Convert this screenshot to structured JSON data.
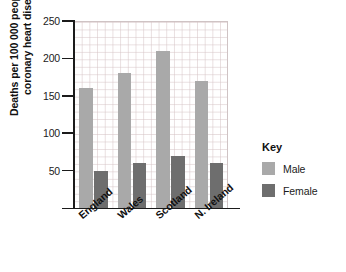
{
  "chart_data": {
    "type": "bar",
    "title": "",
    "xlabel": "",
    "ylabel": "Deaths per 100 000 people from coronary heart disease",
    "ylabel_lines": [
      "Deaths per 100 000 people from",
      "coronary heart disease"
    ],
    "categories": [
      "England",
      "Wales",
      "Scotland",
      "N. Ireland"
    ],
    "series": [
      {
        "name": "Male",
        "color": "#a9a9a9",
        "values": [
          160,
          180,
          210,
          170
        ]
      },
      {
        "name": "Female",
        "color": "#6e6e6e",
        "values": [
          50,
          60,
          70,
          60
        ]
      }
    ],
    "ylim": [
      0,
      250
    ],
    "ytick_values": [
      0,
      50,
      100,
      150,
      200,
      250
    ],
    "ytick_labels": [
      "",
      "50",
      "100",
      "150",
      "200",
      "250"
    ],
    "grid": true,
    "grid_minor": true,
    "legend_position": "right",
    "legend_title": "Key"
  },
  "legend": {
    "title": "Key",
    "entries": [
      {
        "label": "Male",
        "color": "#a9a9a9"
      },
      {
        "label": "Female",
        "color": "#6e6e6e"
      }
    ]
  }
}
